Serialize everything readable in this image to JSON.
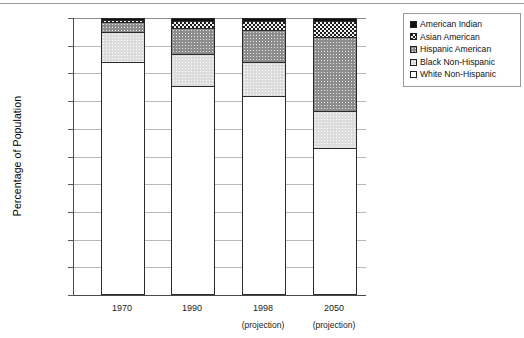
{
  "chart_data": {
    "type": "bar",
    "subtype": "stacked-bar-100-percent",
    "title": "",
    "xlabel": "",
    "ylabel": "Percentage of Population",
    "ylim": [
      0,
      100
    ],
    "ytick_labels": [
      "100%",
      "90%",
      "80%",
      "70%",
      "60%",
      "50%",
      "40%",
      "30%",
      "20%",
      "10%",
      "0%"
    ],
    "ytick_values": [
      100,
      90,
      80,
      70,
      60,
      50,
      40,
      30,
      20,
      10,
      0
    ],
    "grid": true,
    "legend_position": "top-right",
    "categories": [
      "1970",
      "1990",
      "1998",
      "2050"
    ],
    "category_sublabels": [
      "",
      "",
      "(projection)",
      "(projection)"
    ],
    "series": [
      {
        "name": "White Non-Hispanic",
        "pattern": "white",
        "values": [
          84.0,
          75.5,
          72.0,
          53.0
        ]
      },
      {
        "name": "Black Non-Hispanic",
        "pattern": "light-dot",
        "values": [
          11.0,
          11.5,
          12.0,
          13.5
        ]
      },
      {
        "name": "Hispanic American",
        "pattern": "dark-dot",
        "values": [
          3.5,
          9.5,
          11.5,
          26.5
        ]
      },
      {
        "name": "Asian American",
        "pattern": "checker",
        "values": [
          0.8,
          2.5,
          3.5,
          6.0
        ]
      },
      {
        "name": "American Indian",
        "pattern": "solid-black",
        "values": [
          0.7,
          1.0,
          1.0,
          1.0
        ]
      }
    ],
    "stack_boundaries": {
      "1970": [
        84.0,
        95.0,
        98.5,
        99.3,
        100.0
      ],
      "1990": [
        75.5,
        87.0,
        96.5,
        99.0,
        100.0
      ],
      "1998": [
        72.0,
        84.0,
        95.5,
        99.0,
        100.0
      ],
      "2050": [
        53.0,
        66.5,
        93.0,
        99.0,
        100.0
      ]
    }
  },
  "legend": {
    "items": [
      {
        "label": "American Indian",
        "swatch": "solid-black-swatch"
      },
      {
        "label": "Asian American",
        "swatch": "checker-swatch"
      },
      {
        "label": "Hispanic American",
        "swatch": "dark-dot-swatch"
      },
      {
        "label": "Black Non-Hispanic",
        "swatch": "light-dot-swatch"
      },
      {
        "label": "White Non-Hispanic",
        "swatch": "white-swatch"
      }
    ]
  },
  "axis": {
    "y_title": "Percentage of Population"
  }
}
